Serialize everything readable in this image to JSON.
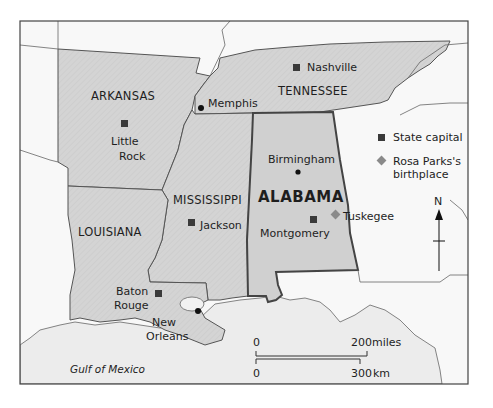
{
  "map": {
    "colors": {
      "land_highlight": "#d2d2d2",
      "alabama": "#cfcfcf",
      "land_other": "#f7f7f7",
      "sea": "#ececec",
      "border": "#555555",
      "capital": "#3a3a3a",
      "birthplace": "#8a8a8a",
      "frame": "#444444"
    },
    "states": [
      {
        "name": "ARKANSAS"
      },
      {
        "name": "TENNESSEE"
      },
      {
        "name": "MISSISSIPPI"
      },
      {
        "name": "LOUISIANA"
      },
      {
        "name": "ALABAMA"
      }
    ],
    "capitals": [
      {
        "name": "Nashville"
      },
      {
        "name_line1": "Little",
        "name_line2": "Rock"
      },
      {
        "name": "Jackson"
      },
      {
        "name_line1": "Baton",
        "name_line2": "Rouge"
      },
      {
        "name": "Montgomery"
      }
    ],
    "cities": [
      {
        "name": "Memphis"
      },
      {
        "name": "Birmingham"
      },
      {
        "name_line1": "New",
        "name_line2": "Orleans"
      }
    ],
    "birthplace": {
      "name": "Tuskegee"
    },
    "water": {
      "name": "Gulf of Mexico"
    },
    "legend": {
      "capital_label": "State capital",
      "birthplace_line1": "Rosa Parks's",
      "birthplace_line2": "birthplace"
    },
    "compass": {
      "label": "N"
    },
    "scale": {
      "miles_start": "0",
      "miles_end": "200",
      "miles_unit": "miles",
      "km_start": "0",
      "km_end": "300",
      "km_unit": "km"
    }
  }
}
